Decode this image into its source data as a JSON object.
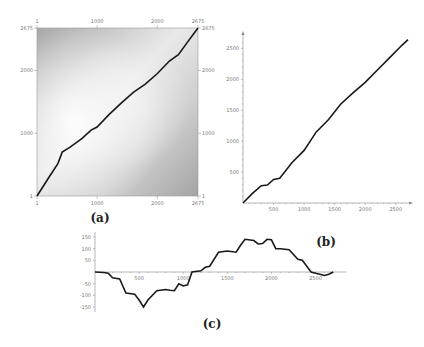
{
  "chart_data": [
    {
      "id": "a",
      "type": "heatmap",
      "caption": "(a)",
      "title": "",
      "xlabel": "",
      "ylabel": "",
      "xlim": [
        1,
        2675
      ],
      "ylim": [
        1,
        2675
      ],
      "x_ticks_top": [
        "1",
        "1000",
        "2000",
        "2675"
      ],
      "x_ticks_bottom": [
        "1",
        "1000",
        "2000",
        "2675"
      ],
      "y_ticks_left": [
        "2675",
        "2000",
        "1000",
        "1"
      ],
      "y_ticks_right": [
        "2675",
        "2000",
        "1000",
        "1"
      ],
      "overlay_path": {
        "x": [
          1,
          200,
          350,
          420,
          550,
          750,
          900,
          1000,
          1200,
          1400,
          1600,
          1800,
          2000,
          2200,
          2350,
          2500,
          2600,
          2675
        ],
        "y": [
          1,
          300,
          520,
          700,
          780,
          920,
          1050,
          1100,
          1300,
          1480,
          1650,
          1780,
          1950,
          2150,
          2250,
          2450,
          2580,
          2675
        ]
      }
    },
    {
      "id": "b",
      "type": "line",
      "caption": "(b)",
      "title": "",
      "xlabel": "",
      "ylabel": "",
      "xlim": [
        0,
        2700
      ],
      "ylim": [
        0,
        2700
      ],
      "x_ticks": [
        "500",
        "1000",
        "1500",
        "2000",
        "2500"
      ],
      "y_ticks": [
        "500",
        "1000",
        "1500",
        "2000",
        "2500"
      ],
      "x": [
        0,
        150,
        300,
        400,
        500,
        600,
        800,
        1000,
        1200,
        1400,
        1600,
        1800,
        2000,
        2200,
        2400,
        2600,
        2700
      ],
      "y": [
        0,
        150,
        280,
        290,
        380,
        400,
        650,
        850,
        1150,
        1350,
        1600,
        1780,
        1950,
        2150,
        2350,
        2550,
        2640
      ]
    },
    {
      "id": "c",
      "type": "line",
      "caption": "(c)",
      "title": "",
      "xlabel": "",
      "ylabel": "",
      "xlim": [
        0,
        2800
      ],
      "ylim": [
        -160,
        160
      ],
      "x_ticks": [
        "500",
        "1000",
        "1500",
        "2000",
        "2500"
      ],
      "y_ticks": [
        "150",
        "100",
        "50",
        "-50",
        "-100",
        "-150"
      ],
      "x": [
        0,
        100,
        150,
        200,
        280,
        350,
        450,
        500,
        550,
        600,
        700,
        800,
        850,
        900,
        950,
        1000,
        1050,
        1100,
        1200,
        1250,
        1300,
        1400,
        1500,
        1600,
        1650,
        1700,
        1800,
        1850,
        1900,
        1950,
        2000,
        2050,
        2100,
        2200,
        2300,
        2350,
        2450,
        2500,
        2550,
        2600,
        2650,
        2700
      ],
      "y": [
        0,
        -2,
        -5,
        -25,
        -30,
        -90,
        -95,
        -120,
        -150,
        -120,
        -80,
        -75,
        -78,
        -80,
        -50,
        -60,
        -55,
        0,
        5,
        20,
        25,
        85,
        90,
        85,
        115,
        140,
        135,
        120,
        122,
        140,
        138,
        100,
        100,
        95,
        55,
        50,
        0,
        -5,
        -10,
        -15,
        -10,
        0
      ]
    }
  ]
}
